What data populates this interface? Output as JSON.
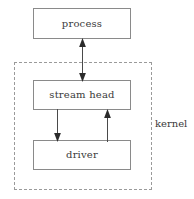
{
  "diagram": {
    "nodes": [
      {
        "id": "process",
        "label": "process"
      },
      {
        "id": "stream_head",
        "label": "stream head"
      },
      {
        "id": "driver",
        "label": "driver"
      }
    ],
    "regions": [
      {
        "id": "kernel",
        "label": "kernel",
        "style": "dashed"
      }
    ],
    "edges": [
      {
        "from": "process",
        "to": "stream_head",
        "direction": "bidirectional"
      },
      {
        "from": "stream_head",
        "to": "driver",
        "direction": "down"
      },
      {
        "from": "driver",
        "to": "stream_head",
        "direction": "up"
      }
    ],
    "colors": {
      "box_border": "#8a8a8a",
      "region_border": "#9a9a9a",
      "text": "#3a3a3a",
      "arrow": "#4a4a4a",
      "background": "#ffffff"
    }
  }
}
